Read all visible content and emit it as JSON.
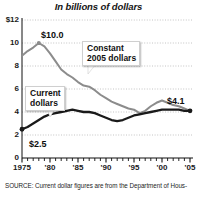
{
  "chart_data": {
    "type": "line",
    "title": "In billions of dollars",
    "xlabel": "",
    "ylabel": "",
    "xlim": [
      1975,
      2006
    ],
    "ylim": [
      0,
      12
    ],
    "grid": true,
    "grid_style": "dotted-horizontal",
    "legend_position": "none (inline callout labels)",
    "y_ticks": [
      "$12",
      "10",
      "8",
      "6",
      "4",
      "2",
      "0"
    ],
    "y_tick_values": [
      12,
      10,
      8,
      6,
      4,
      2,
      0
    ],
    "x_ticks": [
      "1975",
      "'80",
      "'85",
      "'90",
      "'95",
      "'00",
      "'05"
    ],
    "x_tick_values": [
      1975,
      1980,
      1985,
      1990,
      1995,
      2000,
      2005
    ],
    "annotations": [
      {
        "text": "$10.0",
        "series": "Constant 2005 dollars",
        "x": 1978,
        "y": 10.0
      },
      {
        "text": "$2.5",
        "series": "Current dollars",
        "x": 1975,
        "y": 2.5
      },
      {
        "text": "$4.1",
        "series": "both",
        "x": 2005,
        "y": 4.1
      }
    ],
    "callouts": [
      {
        "text_line1": "Constant",
        "text_line2": "2005 dollars",
        "points_to_series": "Constant 2005 dollars"
      },
      {
        "text_line1": "Current",
        "text_line2": "dollars",
        "points_to_series": "Current dollars"
      }
    ],
    "x": [
      1975,
      1976,
      1977,
      1978,
      1979,
      1980,
      1981,
      1982,
      1983,
      1984,
      1985,
      1986,
      1987,
      1988,
      1989,
      1990,
      1991,
      1992,
      1993,
      1994,
      1995,
      1996,
      1997,
      1998,
      1999,
      2000,
      2001,
      2002,
      2003,
      2004,
      2005
    ],
    "series": [
      {
        "name": "Constant 2005 dollars",
        "color": "#8c8c8c",
        "values": [
          8.9,
          9.3,
          9.6,
          10.0,
          9.7,
          9.1,
          8.4,
          7.7,
          7.3,
          7.0,
          6.6,
          6.3,
          6.2,
          5.9,
          5.5,
          5.2,
          4.9,
          4.7,
          4.5,
          4.3,
          4.2,
          3.9,
          4.1,
          4.5,
          4.8,
          5.0,
          4.8,
          4.6,
          4.5,
          4.3,
          4.1
        ]
      },
      {
        "name": "Current dollars",
        "color": "#1a1a1a",
        "values": [
          2.5,
          2.7,
          3.0,
          3.3,
          3.6,
          3.8,
          3.9,
          4.0,
          4.1,
          4.2,
          4.1,
          4.0,
          4.0,
          3.9,
          3.7,
          3.5,
          3.3,
          3.2,
          3.3,
          3.5,
          3.7,
          3.8,
          3.9,
          4.0,
          4.1,
          4.2,
          4.2,
          4.2,
          4.2,
          4.1,
          4.1
        ]
      }
    ],
    "source_note": "SOURCE: Current dollar figures are from the Department of Hous-"
  },
  "colors": {
    "constant_series": "#8c8c8c",
    "current_series": "#1a1a1a",
    "grid": "#b5b5b5",
    "axis": "#111111",
    "background": "#ffffff"
  }
}
